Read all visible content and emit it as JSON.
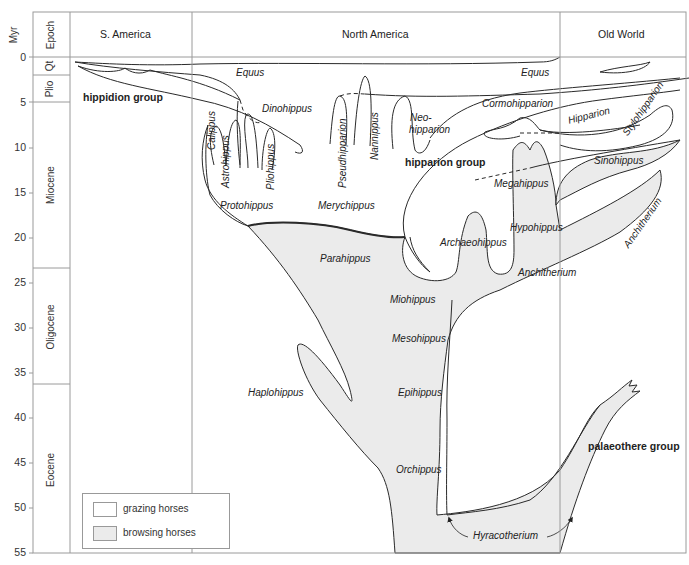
{
  "figure": {
    "type": "phylogeny-diagram",
    "columns": {
      "myr": "Myr",
      "epoch": "Epoch",
      "regions": [
        "S. America",
        "North America",
        "Old World"
      ]
    },
    "time_axis": {
      "unit": "Myr",
      "ticks": [
        "0",
        "5",
        "10",
        "15",
        "20",
        "25",
        "30",
        "35",
        "40",
        "45",
        "50",
        "55"
      ]
    },
    "epochs": [
      {
        "name": "Qt",
        "from": 0,
        "to": 2
      },
      {
        "name": "Plio",
        "from": 2,
        "to": 5
      },
      {
        "name": "Miocene",
        "from": 5,
        "to": 23
      },
      {
        "name": "Oligocene",
        "from": 23,
        "to": 36
      },
      {
        "name": "Eocene",
        "from": 36,
        "to": 55
      }
    ],
    "taxa": {
      "equus_na": "Equus",
      "equus_ow": "Equus",
      "hippidion_group": "hippidion group",
      "dinohippus": "Dinohippus",
      "calippus": "Calippus",
      "astrohippus": "Astrohippus",
      "pliohippus": "Pliohippus",
      "protohippus": "Protohippus",
      "pseudhipparion": "Pseudhipparion",
      "nannippus": "Nannippus",
      "neohipparion_1": "Neo-",
      "neohipparion_2": "hipparion",
      "hipparion_group": "hipparion group",
      "merychippus": "Merychippus",
      "cormohipparion": "Cormohipparion",
      "hipparion": "Hipparion",
      "stylohipparion": "Stylohipparion",
      "megahippus": "Megahippus",
      "sinohippus": "Sinohippus",
      "hypohippus": "Hypohippus",
      "archaeohippus": "Archaeohippus",
      "anchitherium_na": "Anchitherium",
      "anchitherium_ow": "Anchitherium",
      "parahippus": "Parahippus",
      "miohippus": "Miohippus",
      "mesohippus": "Mesohippus",
      "epihippus": "Epihippus",
      "haplohippus": "Haplohippus",
      "orchippus": "Orchippus",
      "hyracotherium": "Hyracotherium",
      "palaeothere_group": "palaeothere group"
    },
    "legend": [
      {
        "label": "grazing horses",
        "fill": "#ffffff"
      },
      {
        "label": "browsing horses",
        "fill": "#ebebeb"
      }
    ],
    "colors": {
      "browsing_fill": "#ebebeb",
      "line": "#2a2a2a",
      "grid": "#9a9a9a"
    }
  }
}
